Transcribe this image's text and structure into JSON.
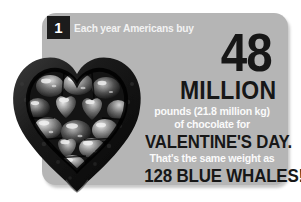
{
  "card": {
    "badge_number": "1",
    "panel_color": "#b5b5b5",
    "dark_text_color": "#171717",
    "light_text_color": "#f7f7f7",
    "badge_background": "#1c1c1c"
  },
  "content": {
    "lede": "Each year Americans buy",
    "big_number": "48",
    "unit": "MILLION",
    "detail_line_1": "pounds (21.8 million kg)",
    "detail_line_2": "of chocolate for",
    "occasion": "VALENTINE'S DAY.",
    "comparison_intro": "That's the same weight as",
    "comparison_value": "128 BLUE WHALES!"
  },
  "image": {
    "name": "heart-shaped-box-of-foil-wrapped-chocolates",
    "description": "Dark heart-shaped chocolate box filled with foil-wrapped heart chocolates"
  }
}
